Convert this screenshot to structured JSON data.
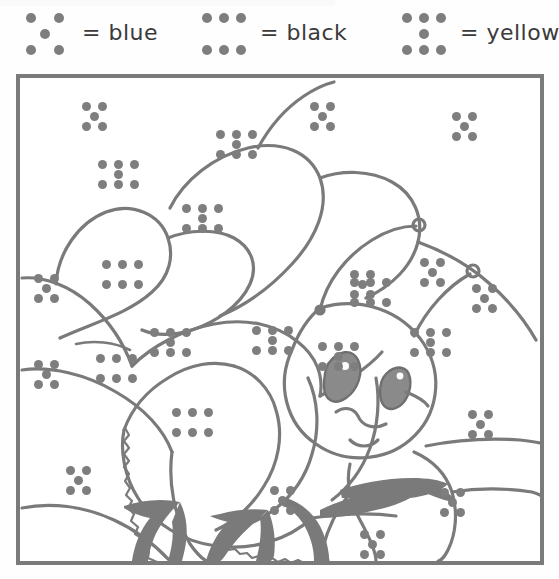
{
  "worksheet": {
    "type": "color-by-number-dots",
    "subject": "bee on flower petals",
    "frame": {
      "stroke_color": "#7a7a7a",
      "background": "#ffffff"
    },
    "line_color": "#7a7a7a",
    "dot_color": "#7e7e7e"
  },
  "legend": {
    "title": "",
    "entries": [
      {
        "pattern": "five-dot",
        "dot_count": 5,
        "equals": "=",
        "label": "blue",
        "color": "#0000ff"
      },
      {
        "pattern": "six-dot",
        "dot_count": 6,
        "equals": "=",
        "label": "black",
        "color": "#000000"
      },
      {
        "pattern": "seven-dot",
        "dot_count": 7,
        "equals": "=",
        "label": "yellow",
        "color": "#ffff00"
      }
    ]
  },
  "regions": [
    {
      "id": "petal-top-left-upper",
      "pattern": "five-dot",
      "color": "blue",
      "x": 62,
      "y": 24
    },
    {
      "id": "petal-top-left-big",
      "pattern": "seven-dot",
      "color": "yellow",
      "x": 78,
      "y": 82
    },
    {
      "id": "petal-top-mid",
      "pattern": "seven-dot",
      "color": "yellow",
      "x": 196,
      "y": 52
    },
    {
      "id": "petal-top-right-area",
      "pattern": "five-dot",
      "color": "blue",
      "x": 290,
      "y": 24
    },
    {
      "id": "petal-upper-right",
      "pattern": "five-dot",
      "color": "blue",
      "x": 432,
      "y": 34
    },
    {
      "id": "petal-center",
      "pattern": "seven-dot",
      "color": "yellow",
      "x": 162,
      "y": 126
    },
    {
      "id": "petal-center-right",
      "pattern": "five-dot",
      "color": "blue",
      "x": 330,
      "y": 192
    },
    {
      "id": "petal-mid-left-out",
      "pattern": "five-dot",
      "color": "blue",
      "x": 14,
      "y": 196
    },
    {
      "id": "petal-mid-band",
      "pattern": "seven-dot",
      "color": "yellow",
      "x": 130,
      "y": 250
    },
    {
      "id": "petal-right-band",
      "pattern": "seven-dot",
      "color": "yellow",
      "x": 390,
      "y": 250
    },
    {
      "id": "bee-head",
      "pattern": "seven-dot",
      "color": "yellow",
      "x": 298,
      "y": 264
    },
    {
      "id": "antenna-right-region",
      "pattern": "five-dot",
      "color": "blue",
      "x": 400,
      "y": 180
    },
    {
      "id": "wing-left-lower",
      "pattern": "six-dot",
      "color": "black",
      "x": 152,
      "y": 330
    },
    {
      "id": "wing-mid-lower",
      "pattern": "seven-dot",
      "color": "yellow",
      "x": 232,
      "y": 248
    },
    {
      "id": "wing-right-lower",
      "pattern": "six-dot",
      "color": "black",
      "x": 330,
      "y": 200
    },
    {
      "id": "body-left-side",
      "pattern": "six-dot",
      "color": "black",
      "x": 76,
      "y": 276
    },
    {
      "id": "body-stripe",
      "pattern": "six-dot",
      "color": "black",
      "x": 82,
      "y": 182
    },
    {
      "id": "flower-left-edge",
      "pattern": "five-dot",
      "color": "blue",
      "x": 14,
      "y": 282
    },
    {
      "id": "bee-abdomen",
      "pattern": "five-dot",
      "color": "blue",
      "x": 340,
      "y": 452
    },
    {
      "id": "bee-thorax-right",
      "pattern": "five-dot",
      "color": "blue",
      "x": 448,
      "y": 332
    },
    {
      "id": "lower-right-petal",
      "pattern": "five-dot",
      "color": "blue",
      "x": 452,
      "y": 206
    },
    {
      "id": "bottom-left-petal",
      "pattern": "five-dot",
      "color": "blue",
      "x": 250,
      "y": 408
    },
    {
      "id": "bottom-mid-petal",
      "pattern": "five-dot",
      "color": "blue",
      "x": 420,
      "y": 410
    },
    {
      "id": "bottom-far-left",
      "pattern": "five-dot",
      "color": "blue",
      "x": 46,
      "y": 388
    }
  ],
  "dot_patterns": {
    "five-dot": {
      "cols": 2,
      "rows": 2,
      "center": true,
      "label": "dice-five"
    },
    "six-dot": {
      "cols": 3,
      "rows": 2,
      "center": false,
      "label": "two-rows-of-three"
    },
    "seven-dot": {
      "cols": 3,
      "rows": 2,
      "center": true,
      "label": "two-rows-of-three-plus-center"
    }
  }
}
